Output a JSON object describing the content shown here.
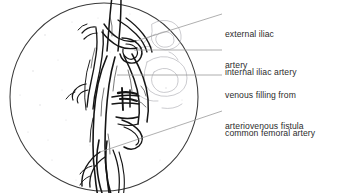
{
  "figure": {
    "type": "medical-illustration",
    "modality": "angiogram-line-drawing",
    "region": "pelvic arteries",
    "view_shape": "circular",
    "background_color": "#ffffff",
    "ink_color": "#1a1a1a",
    "leader_line_color": "#9a9a9a",
    "text_color": "#2b2b2b",
    "circle": {
      "center_x": 104,
      "center_y": 97,
      "radius": 94,
      "cropped_edges": [
        "top",
        "bottom"
      ]
    }
  },
  "annotations": [
    {
      "id": "external-iliac-artery",
      "lines": [
        "external iliac",
        "artery"
      ],
      "text_x": 225,
      "text_y": 8,
      "leader": {
        "x1": 222,
        "y1": 14,
        "x2": 136,
        "y2": 41
      }
    },
    {
      "id": "internal-iliac-artery",
      "lines": [
        "internal iliac artery"
      ],
      "text_x": 225,
      "text_y": 46,
      "leader": {
        "x1": 222,
        "y1": 50,
        "x2": 134,
        "y2": 50
      }
    },
    {
      "id": "venous-filling-from-arteriovenous-fistula",
      "lines": [
        "venous filling from",
        "arteriovenous fistula"
      ],
      "text_x": 225,
      "text_y": 69,
      "leader": {
        "x1": 222,
        "y1": 75,
        "x2": 117,
        "y2": 75
      }
    },
    {
      "id": "common-femoral-artery",
      "lines": [
        "common femoral artery"
      ],
      "text_x": 225,
      "text_y": 107,
      "leader": {
        "x1": 222,
        "y1": 111,
        "x2": 100,
        "y2": 152
      }
    }
  ]
}
